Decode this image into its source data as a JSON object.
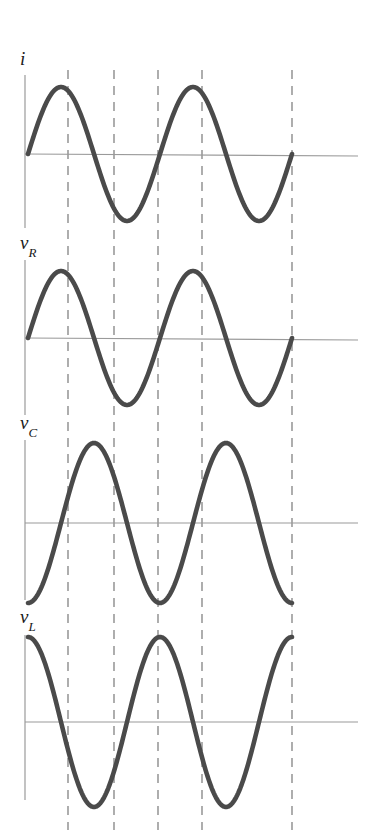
{
  "figure": {
    "background_color": "#ffffff",
    "curve_color": "#4a4a4a",
    "axis_color": "#9a9a9a",
    "dashed_color": "#8c8c8c",
    "label_color": "#1a1a1a",
    "width": 381,
    "height": 840
  },
  "axes_geometry": {
    "y_axis_x": 25,
    "wave_start_x": 28,
    "wave_end_x": 292,
    "axis_right_x": 358,
    "dashed_lines_x": [
      68,
      114,
      158,
      202,
      292
    ],
    "dashed_top_y": 70,
    "dashed_bottom_y": 830,
    "panel_baselines_y": [
      154,
      338,
      523,
      722
    ],
    "panel_amplitude_px": [
      67,
      67,
      80,
      85
    ],
    "panel_axis_top_y": [
      75,
      260,
      440,
      635
    ],
    "panel_axis_bottom_y": [
      228,
      415,
      600,
      800
    ]
  },
  "panels": [
    {
      "id": "current",
      "label_main": "i",
      "label_sub": "",
      "label_x": 20,
      "label_y": 48,
      "baseline_y": 154,
      "amplitude": 67,
      "phase_deg": 0,
      "cycles": 2,
      "description": "Current i, reference sine starting at zero going positive"
    },
    {
      "id": "resistor-voltage",
      "label_main": "v",
      "label_sub": "R",
      "label_x": 20,
      "label_y": 232,
      "baseline_y": 338,
      "amplitude": 67,
      "phase_deg": 0,
      "cycles": 2,
      "description": "Resistor voltage v_R, in phase with current"
    },
    {
      "id": "capacitor-voltage",
      "label_main": "v",
      "label_sub": "C",
      "label_x": 20,
      "label_y": 412,
      "baseline_y": 523,
      "amplitude": 80,
      "phase_deg": -90,
      "cycles": 2,
      "description": "Capacitor voltage v_C, lags current by 90 degrees"
    },
    {
      "id": "inductor-voltage",
      "label_main": "v",
      "label_sub": "L",
      "label_x": 20,
      "label_y": 606,
      "baseline_y": 722,
      "amplitude": 85,
      "phase_deg": 90,
      "cycles": 2,
      "description": "Inductor voltage v_L, leads current by 90 degrees"
    }
  ],
  "chart_data": {
    "type": "line",
    "xlabel": "",
    "ylabel": "",
    "grid": false,
    "legend_position": "none",
    "x": "omega t from 0 to 4pi (two full cycles)",
    "xlim": [
      0,
      720
    ],
    "ylim": [
      -1,
      1
    ],
    "vertical_reference_lines_deg": [
      90,
      180,
      270,
      360,
      720
    ],
    "series": [
      {
        "name": "i",
        "phase_deg": 0,
        "amplitude": 1,
        "formula": "sin(wt)",
        "key_points_deg_value": [
          [
            0,
            0
          ],
          [
            90,
            1
          ],
          [
            180,
            0
          ],
          [
            270,
            -1
          ],
          [
            360,
            0
          ],
          [
            450,
            1
          ],
          [
            540,
            0
          ],
          [
            630,
            -1
          ],
          [
            720,
            0
          ]
        ]
      },
      {
        "name": "v_R",
        "phase_deg": 0,
        "amplitude": 1,
        "formula": "sin(wt)",
        "key_points_deg_value": [
          [
            0,
            0
          ],
          [
            90,
            1
          ],
          [
            180,
            0
          ],
          [
            270,
            -1
          ],
          [
            360,
            0
          ],
          [
            450,
            1
          ],
          [
            540,
            0
          ],
          [
            630,
            -1
          ],
          [
            720,
            0
          ]
        ]
      },
      {
        "name": "v_C",
        "phase_deg": -90,
        "amplitude": 1,
        "formula": "-cos(wt)",
        "key_points_deg_value": [
          [
            0,
            -1
          ],
          [
            90,
            0
          ],
          [
            180,
            1
          ],
          [
            270,
            0
          ],
          [
            360,
            -1
          ],
          [
            450,
            0
          ],
          [
            540,
            1
          ],
          [
            630,
            0
          ],
          [
            720,
            1
          ]
        ]
      },
      {
        "name": "v_L",
        "phase_deg": 90,
        "amplitude": 1,
        "formula": "cos(wt)",
        "key_points_deg_value": [
          [
            0,
            1
          ],
          [
            90,
            0
          ],
          [
            180,
            -1
          ],
          [
            270,
            0
          ],
          [
            360,
            1
          ],
          [
            450,
            0
          ],
          [
            540,
            -1
          ],
          [
            630,
            0
          ],
          [
            720,
            -1
          ]
        ]
      }
    ]
  }
}
